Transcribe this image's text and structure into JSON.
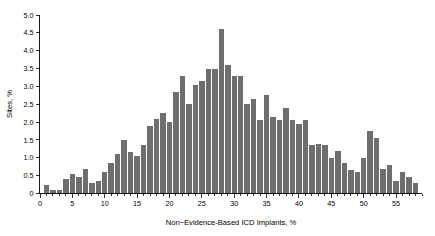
{
  "figure": {
    "background_color": "#ffffff",
    "bar_color": "#6e6e6e",
    "axis_color": "#000000"
  },
  "chart_data": {
    "type": "bar",
    "title": "",
    "xlabel": "Non−Evidence-Based ICD Implants, %",
    "ylabel": "Sites, %",
    "xlim": [
      0,
      59
    ],
    "ylim": [
      0,
      5.0
    ],
    "grid": false,
    "legend": null,
    "bin_width": 1,
    "x_ticks": [
      0,
      5,
      10,
      15,
      20,
      25,
      30,
      35,
      40,
      45,
      50,
      55
    ],
    "x_tick_labels": [
      "0",
      "5",
      "10",
      "15",
      "20",
      "25",
      "30",
      "35",
      "40",
      "45",
      "50",
      "55"
    ],
    "y_ticks": [
      0,
      0.5,
      1.0,
      1.5,
      2.0,
      2.5,
      3.0,
      3.5,
      4.0,
      4.5,
      5.0
    ],
    "y_tick_labels": [
      "0",
      "0.5",
      "1.0",
      "1.5",
      "2.0",
      "2.5",
      "3.0",
      "3.5",
      "4.0",
      "4.5",
      "5.0"
    ],
    "x": [
      1,
      2,
      3,
      4,
      5,
      6,
      7,
      8,
      9,
      10,
      11,
      12,
      13,
      14,
      15,
      16,
      17,
      18,
      19,
      20,
      21,
      22,
      23,
      24,
      25,
      26,
      27,
      28,
      29,
      30,
      31,
      32,
      33,
      34,
      35,
      36,
      37,
      38,
      39,
      40,
      41,
      42,
      43,
      44,
      45,
      46,
      47,
      48,
      49,
      50,
      51,
      52,
      53,
      54,
      55,
      56,
      57,
      58
    ],
    "categories": [
      "1",
      "2",
      "3",
      "4",
      "5",
      "6",
      "7",
      "8",
      "9",
      "10",
      "11",
      "12",
      "13",
      "14",
      "15",
      "16",
      "17",
      "18",
      "19",
      "20",
      "21",
      "22",
      "23",
      "24",
      "25",
      "26",
      "27",
      "28",
      "29",
      "30",
      "31",
      "32",
      "33",
      "34",
      "35",
      "36",
      "37",
      "38",
      "39",
      "40",
      "41",
      "42",
      "43",
      "44",
      "45",
      "46",
      "47",
      "48",
      "49",
      "50",
      "51",
      "52",
      "53",
      "54",
      "55",
      "56",
      "57",
      "58"
    ],
    "values": [
      0.25,
      0.1,
      0.1,
      0.4,
      0.55,
      0.45,
      0.7,
      0.3,
      0.35,
      0.6,
      0.85,
      1.1,
      1.5,
      1.15,
      1.05,
      1.35,
      1.9,
      2.1,
      2.25,
      2.0,
      2.85,
      3.3,
      2.5,
      3.05,
      3.15,
      3.5,
      3.5,
      4.6,
      3.6,
      3.3,
      3.3,
      2.5,
      2.65,
      2.05,
      2.75,
      2.15,
      2.05,
      2.4,
      2.05,
      1.95,
      2.05,
      1.35,
      1.4,
      1.35,
      1.0,
      1.2,
      0.85,
      0.65,
      0.6,
      1.0,
      1.75,
      1.55,
      0.7,
      0.8,
      0.35,
      0.6,
      0.45,
      0.3
    ],
    "data_note": "Histogram of non-evidence-based ICD implant rate across sites"
  }
}
